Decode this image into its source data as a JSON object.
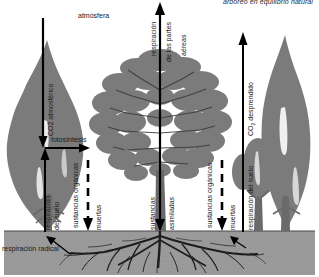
{
  "figure": {
    "caption_top": "arbóreo en equilibrio natural",
    "atmosphere_label": "atmósfera"
  },
  "labels": {
    "co2_atmospheric": "CO2 atmosférico",
    "co2_atmospheric_base": "CO",
    "co2_atmospheric_sub": "2",
    "co2_atmospheric_rest": " atmosférico",
    "photosynthesis": "fotosíntesis",
    "soil_respiration_left": "respiración del suelo",
    "soil_respiration_left_l1": "respiración",
    "soil_respiration_left_l2": "del suelo",
    "dead_organic_left_l1": "sustancias orgánicas",
    "dead_organic_left_l2": "muertas",
    "aerial_respiration_l1": "respiración",
    "aerial_respiration_l2": "de las partes",
    "aerial_respiration_l3": "aéreas",
    "assimilated_l1": "sustancias",
    "assimilated_l2": "asimiladas",
    "dead_organic_right_l1": "sustancias orgánicas",
    "dead_organic_right_l2": "muertas",
    "soil_respiration_right": "respiración del suelo",
    "co2_released_base": "CO",
    "co2_released_sub": "2",
    "co2_released_rest": " desprendido",
    "root_respiration": "respiración radical"
  },
  "colors": {
    "foliage": "#7b7b7b",
    "foliage_dark": "#6e6e6e",
    "soil": "#9a9a9a",
    "soil_speckle": "#808080",
    "arrow": "#000000",
    "background": "#ffffff",
    "text": "#1a1a1a"
  },
  "geometry": {
    "width": 319,
    "height": 277,
    "soil_top_y": 231,
    "left_tree_x": 47,
    "center_tree_x": 160,
    "right_tree_x": 285
  }
}
